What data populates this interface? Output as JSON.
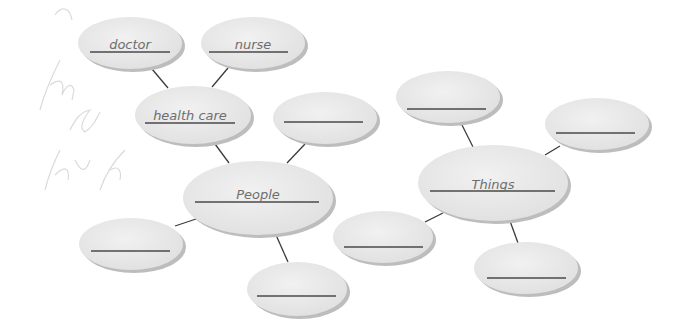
{
  "diagram": {
    "type": "web organizer",
    "colors": {
      "bubble_fill": "#e9e9e9",
      "bubble_shadow": "#b9b9b9",
      "line": "#3a3a3a",
      "text": "#6e6e6e",
      "pencil": "#d6d6d6"
    },
    "centers": [
      {
        "id": "people",
        "label": "People"
      },
      {
        "id": "things",
        "label": "Things"
      }
    ],
    "nodes": {
      "doctor": {
        "label": "doctor"
      },
      "nurse": {
        "label": "nurse"
      },
      "health_care": {
        "label": "health care"
      },
      "people_top_right": {
        "label": ""
      },
      "people_left": {
        "label": ""
      },
      "people_bottom": {
        "label": ""
      },
      "things_top": {
        "label": ""
      },
      "things_right": {
        "label": ""
      },
      "things_left": {
        "label": ""
      },
      "things_bottom": {
        "label": ""
      }
    },
    "edges": [
      [
        "doctor",
        "health_care"
      ],
      [
        "nurse",
        "health_care"
      ],
      [
        "health_care",
        "people"
      ],
      [
        "people_top_right",
        "people"
      ],
      [
        "people_left",
        "people"
      ],
      [
        "people_bottom",
        "people"
      ],
      [
        "things_top",
        "things"
      ],
      [
        "things_right",
        "things"
      ],
      [
        "things_left",
        "things"
      ],
      [
        "things_bottom",
        "things"
      ]
    ],
    "pencil_marks": "faint handwriting (illegible)"
  }
}
